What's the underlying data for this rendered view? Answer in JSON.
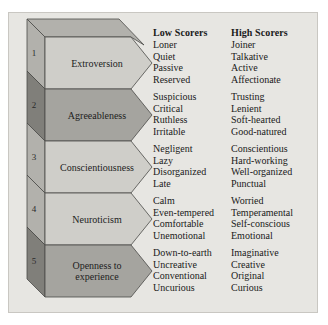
{
  "figure": {
    "title": "",
    "background_color": "#e7e6e2",
    "band_color_light": "#cfcec9",
    "band_color_dark": "#a5a49f",
    "side_color_light": "#b2b1ac",
    "side_color_dark": "#807f7a",
    "outline_color": "#4a4a48"
  },
  "headers": {
    "low": "Low Scorers",
    "high": "High Scorers"
  },
  "traits": [
    {
      "number": "1",
      "name": "Extroversion",
      "shade": "light",
      "low": [
        "Loner",
        "Quiet",
        "Passive",
        "Reserved"
      ],
      "high": [
        "Joiner",
        "Talkative",
        "Active",
        "Affectionate"
      ]
    },
    {
      "number": "2",
      "name": "Agreeableness",
      "shade": "dark",
      "low": [
        "Suspicious",
        "Critical",
        "Ruthless",
        "Irritable"
      ],
      "high": [
        "Trusting",
        "Lenient",
        "Soft-hearted",
        "Good-natured"
      ]
    },
    {
      "number": "3",
      "name": "Conscientiousness",
      "shade": "light",
      "low": [
        "Negligent",
        "Lazy",
        "Disorganized",
        "Late"
      ],
      "high": [
        "Conscientious",
        "Hard-working",
        "Well-organized",
        "Punctual"
      ]
    },
    {
      "number": "4",
      "name": "Neuroticism",
      "shade": "light",
      "low": [
        "Calm",
        "Even-tempered",
        "Comfortable",
        "Unemotional"
      ],
      "high": [
        "Worried",
        "Temperamental",
        "Self-conscious",
        "Emotional"
      ]
    },
    {
      "number": "5",
      "name": "Openness to experience",
      "shade": "dark",
      "low": [
        "Down-to-earth",
        "Uncreative",
        "Conventional",
        "Uncurious"
      ],
      "high": [
        "Imaginative",
        "Creative",
        "Original",
        "Curious"
      ]
    }
  ]
}
